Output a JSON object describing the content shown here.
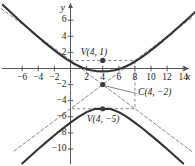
{
  "figure": {
    "kind": "hyperbola-graph",
    "background_color": "#ffffff",
    "curve_color": "#333333",
    "axis_color": "#555555",
    "dashed_color": "#777777",
    "point_color": "#3b3b3b",
    "width": 195,
    "height": 166
  },
  "axes": {
    "x_name": "x",
    "y_name": "y",
    "x_ticks": [
      {
        "value": -6,
        "label": "−6"
      },
      {
        "value": -4,
        "label": "−4"
      },
      {
        "value": -2,
        "label": "−2"
      },
      {
        "value": 2,
        "label": "2"
      },
      {
        "value": 4,
        "label": "4"
      },
      {
        "value": 6,
        "label": "6"
      },
      {
        "value": 8,
        "label": "8"
      },
      {
        "value": 10,
        "label": "10"
      },
      {
        "value": 12,
        "label": "12"
      },
      {
        "value": 14,
        "label": "14"
      }
    ],
    "y_ticks": [
      {
        "value": 6,
        "label": "6"
      },
      {
        "value": 4,
        "label": "4"
      },
      {
        "value": 2,
        "label": "2"
      },
      {
        "value": -2,
        "label": "−2"
      },
      {
        "value": -4,
        "label": "−4"
      },
      {
        "value": -6,
        "label": "−6"
      },
      {
        "value": -8,
        "label": "−8"
      },
      {
        "value": -10,
        "label": "−10"
      }
    ]
  },
  "annotations": {
    "vertex_upper": "V(4, 1)",
    "center": "C(4, −2)",
    "vertex_lower": "V(4, −5)"
  },
  "chart_data": {
    "type": "line",
    "title": "",
    "xlabel": "x",
    "ylabel": "y",
    "xlim": [
      -9,
      16
    ],
    "ylim": [
      -12,
      8
    ],
    "grid": false,
    "legend": "none",
    "conic": {
      "form": "hyperbola",
      "orientation": "vertical",
      "center": {
        "x": 4,
        "y": -2
      },
      "a": 3,
      "b": 4,
      "vertices": [
        {
          "x": 4,
          "y": 1,
          "label": "V(4, 1)"
        },
        {
          "x": 4,
          "y": -5,
          "label": "V(4, −5)"
        }
      ],
      "asymptote_slopes": [
        0.75,
        -0.75
      ],
      "aux_rectangle": {
        "x_min": 0,
        "x_max": 8,
        "y_min": -5,
        "y_max": 1
      }
    },
    "series": [
      {
        "name": "upper-branch",
        "style": "solid",
        "points": [
          {
            "x": -8.4,
            "y": 7.9
          },
          {
            "x": -7.5,
            "y": 7.05
          },
          {
            "x": -6.5,
            "y": 6.12
          },
          {
            "x": -5.5,
            "y": 5.21
          },
          {
            "x": -4.5,
            "y": 4.33
          },
          {
            "x": -3.5,
            "y": 3.47
          },
          {
            "x": -2.5,
            "y": 2.65
          },
          {
            "x": -1.5,
            "y": 1.88
          },
          {
            "x": -0.5,
            "y": 1.17
          },
          {
            "x": 0.5,
            "y": 0.56
          },
          {
            "x": 1.5,
            "y": 0.09
          },
          {
            "x": 2.5,
            "y": -0.21
          },
          {
            "x": 3.2,
            "y": -0.32
          },
          {
            "x": 4.0,
            "y": -0.36
          },
          {
            "x": 4.8,
            "y": -0.32
          },
          {
            "x": 5.5,
            "y": -0.21
          },
          {
            "x": 6.5,
            "y": 0.09
          },
          {
            "x": 7.5,
            "y": 0.56
          },
          {
            "x": 8.5,
            "y": 1.17
          },
          {
            "x": 9.5,
            "y": 1.88
          },
          {
            "x": 10.5,
            "y": 2.65
          },
          {
            "x": 11.5,
            "y": 3.47
          },
          {
            "x": 12.5,
            "y": 4.33
          },
          {
            "x": 13.5,
            "y": 5.21
          },
          {
            "x": 14.5,
            "y": 6.12
          },
          {
            "x": 15.6,
            "y": 7.13
          }
        ]
      },
      {
        "name": "lower-branch",
        "style": "solid",
        "points": [
          {
            "x": -6.0,
            "y": -11.8
          },
          {
            "x": -5.0,
            "y": -10.9
          },
          {
            "x": -4.0,
            "y": -10.0
          },
          {
            "x": -3.0,
            "y": -9.14
          },
          {
            "x": -2.0,
            "y": -8.3
          },
          {
            "x": -1.0,
            "y": -7.49
          },
          {
            "x": 0.0,
            "y": -6.72
          },
          {
            "x": 1.0,
            "y": -6.02
          },
          {
            "x": 2.0,
            "y": -5.42
          },
          {
            "x": 3.0,
            "y": -5.02
          },
          {
            "x": 4.0,
            "y": -5.0
          },
          {
            "x": 5.0,
            "y": -5.02
          },
          {
            "x": 6.0,
            "y": -5.42
          },
          {
            "x": 7.0,
            "y": -6.02
          },
          {
            "x": 8.0,
            "y": -6.72
          },
          {
            "x": 9.0,
            "y": -7.49
          },
          {
            "x": 10.0,
            "y": -8.3
          },
          {
            "x": 11.0,
            "y": -9.14
          },
          {
            "x": 12.0,
            "y": -10.0
          },
          {
            "x": 13.0,
            "y": -10.9
          },
          {
            "x": 14.0,
            "y": -11.8
          }
        ]
      },
      {
        "name": "asymptote-negative-slope",
        "style": "dashed",
        "points": [
          {
            "x": -8.6,
            "y": 7.45
          },
          {
            "x": 15.2,
            "y": -10.4
          }
        ]
      },
      {
        "name": "asymptote-positive-slope",
        "style": "dashed",
        "points": [
          {
            "x": -7.0,
            "y": -10.25
          },
          {
            "x": 15.2,
            "y": 6.4
          }
        ]
      }
    ]
  },
  "points": [
    {
      "name": "vertex-upper",
      "x": 4,
      "y": 1
    },
    {
      "name": "center",
      "x": 4,
      "y": -2
    },
    {
      "name": "vertex-lower",
      "x": 4,
      "y": -5
    }
  ]
}
